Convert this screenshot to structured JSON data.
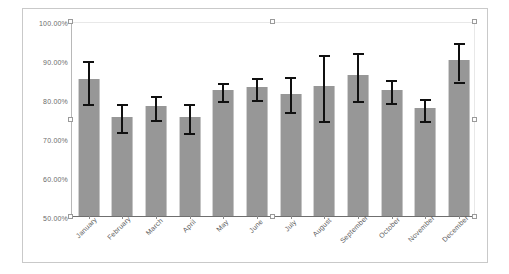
{
  "chart_data": {
    "type": "bar",
    "title": "",
    "subtitle": "",
    "xlabel": "",
    "ylabel": "",
    "ylim": [
      50,
      100
    ],
    "grid": false,
    "legend": null,
    "categories": [
      "January",
      "February",
      "March",
      "April",
      "May",
      "June",
      "July",
      "August",
      "September",
      "October",
      "November",
      "December"
    ],
    "ytick_labels": [
      "100.00%",
      "90.00%",
      "80.00%",
      "70.00%",
      "60.00%",
      "50.00%"
    ],
    "ytick_values": [
      100,
      90,
      80,
      70,
      60,
      50
    ],
    "series": [
      {
        "name": "Percent",
        "values": [
          85.1,
          75.5,
          78.2,
          75.4,
          82.2,
          83.0,
          81.4,
          83.3,
          86.2,
          82.4,
          77.7,
          90.0
        ],
        "error_low": [
          79.2,
          72.0,
          75.1,
          71.8,
          79.9,
          80.3,
          77.1,
          74.9,
          80.0,
          79.6,
          74.9,
          85.0
        ],
        "error_high": [
          90.2,
          79.2,
          81.3,
          79.3,
          84.6,
          85.9,
          86.1,
          91.8,
          92.4,
          85.3,
          80.6,
          94.9
        ],
        "color": "#979797"
      }
    ],
    "error_bar_color": "#101010",
    "plot_background": "#ffffff",
    "frame_border_color": "#c9c9c9"
  },
  "selection": {
    "handle_count": 8,
    "handle_border_color": "#9a9a9a",
    "handle_fill": "#fdfdfd"
  }
}
